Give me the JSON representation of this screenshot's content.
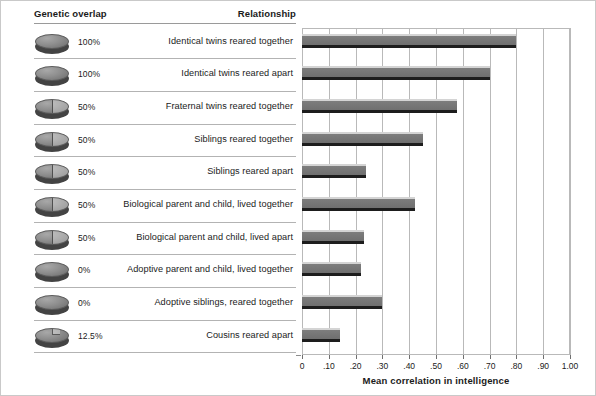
{
  "table": {
    "headers": {
      "genetic_overlap": "Genetic overlap",
      "relationship": "Relationship"
    },
    "rows": [
      {
        "overlap_label": "100%",
        "overlap_value": 100,
        "relationship": "Identical twins reared together",
        "icon": "disc-full-icon"
      },
      {
        "overlap_label": "100%",
        "overlap_value": 100,
        "relationship": "Identical twins reared apart",
        "icon": "disc-full-icon"
      },
      {
        "overlap_label": "50%",
        "overlap_value": 50,
        "relationship": "Fraternal twins reared together",
        "icon": "disc-half-icon"
      },
      {
        "overlap_label": "50%",
        "overlap_value": 50,
        "relationship": "Siblings reared together",
        "icon": "disc-half-icon"
      },
      {
        "overlap_label": "50%",
        "overlap_value": 50,
        "relationship": "Siblings reared apart",
        "icon": "disc-half-icon"
      },
      {
        "overlap_label": "50%",
        "overlap_value": 50,
        "relationship": "Biological parent and child, lived together",
        "icon": "disc-half-icon"
      },
      {
        "overlap_label": "50%",
        "overlap_value": 50,
        "relationship": "Biological parent and child, lived apart",
        "icon": "disc-half-icon"
      },
      {
        "overlap_label": "0%",
        "overlap_value": 0,
        "relationship": "Adoptive parent and child, lived together",
        "icon": "disc-empty-icon"
      },
      {
        "overlap_label": "0%",
        "overlap_value": 0,
        "relationship": "Adoptive siblings, reared together",
        "icon": "disc-empty-icon"
      },
      {
        "overlap_label": "12.5%",
        "overlap_value": 12.5,
        "relationship": "Cousins reared apart",
        "icon": "disc-eighth-icon"
      }
    ]
  },
  "chart_data": {
    "type": "bar",
    "orientation": "horizontal",
    "title": "",
    "xlabel": "Mean correlation in intelligence",
    "ylabel": "",
    "xlim": [
      0,
      1.0
    ],
    "xticks": [
      0,
      0.1,
      0.2,
      0.3,
      0.4,
      0.5,
      0.6,
      0.7,
      0.8,
      0.9,
      1.0
    ],
    "xticklabels": [
      "0",
      ".10",
      ".20",
      ".30",
      ".40",
      ".50",
      ".60",
      ".70",
      ".80",
      ".90",
      "1.00"
    ],
    "grid": "vertical",
    "legend": "none",
    "categories": [
      "Identical twins reared together",
      "Identical twins reared apart",
      "Fraternal twins reared together",
      "Siblings reared together",
      "Siblings reared apart",
      "Biological parent and child, lived together",
      "Biological parent and child, lived apart",
      "Adoptive parent and child, lived together",
      "Adoptive siblings, reared together",
      "Cousins reared apart"
    ],
    "values": [
      0.8,
      0.7,
      0.58,
      0.45,
      0.24,
      0.42,
      0.23,
      0.22,
      0.3,
      0.14
    ],
    "bar_color": "#6f6f6f",
    "bar_highlight_color": "#d4d4d4",
    "bar_base_color": "#1d1d1d",
    "grid_color": "#b9b9b9"
  }
}
